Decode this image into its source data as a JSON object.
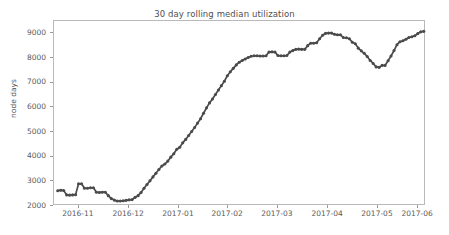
{
  "chart_data": {
    "type": "line",
    "title": "30 day rolling median utilization",
    "xlabel": "",
    "ylabel": "node days",
    "grid": false,
    "legend": null,
    "marker": "circle",
    "line_color": "#4a4a4a",
    "ylim": [
      2000,
      9500
    ],
    "yticks": [
      2000,
      3000,
      4000,
      5000,
      6000,
      7000,
      8000,
      9000
    ],
    "ytick_labels": [
      "2000",
      "3000",
      "4000",
      "5000",
      "6000",
      "7000",
      "8000",
      "9000"
    ],
    "xticks": [
      "2016-11",
      "2016-12",
      "2017-01",
      "2017-02",
      "2017-03",
      "2017-04",
      "2017-05",
      "2017-06"
    ],
    "xtick_positions_frac": [
      0.067,
      0.202,
      0.336,
      0.468,
      0.602,
      0.737,
      0.871,
      0.979
    ],
    "x": [
      0.01,
      0.018,
      0.026,
      0.034,
      0.042,
      0.05,
      0.058,
      0.066,
      0.074,
      0.082,
      0.09,
      0.098,
      0.106,
      0.114,
      0.122,
      0.13,
      0.138,
      0.146,
      0.154,
      0.162,
      0.17,
      0.178,
      0.186,
      0.194,
      0.202,
      0.21,
      0.218,
      0.226,
      0.234,
      0.242,
      0.25,
      0.258,
      0.266,
      0.274,
      0.282,
      0.29,
      0.298,
      0.306,
      0.314,
      0.322,
      0.33,
      0.338,
      0.346,
      0.354,
      0.362,
      0.37,
      0.378,
      0.386,
      0.394,
      0.402,
      0.41,
      0.418,
      0.426,
      0.434,
      0.442,
      0.45,
      0.458,
      0.466,
      0.474,
      0.482,
      0.49,
      0.498,
      0.506,
      0.514,
      0.522,
      0.53,
      0.538,
      0.546,
      0.554,
      0.562,
      0.57,
      0.578,
      0.586,
      0.594,
      0.602,
      0.61,
      0.618,
      0.626,
      0.634,
      0.642,
      0.65,
      0.658,
      0.666,
      0.674,
      0.682,
      0.69,
      0.698,
      0.706,
      0.714,
      0.722,
      0.73,
      0.738,
      0.746,
      0.754,
      0.762,
      0.77,
      0.778,
      0.786,
      0.794,
      0.802,
      0.81,
      0.818,
      0.826,
      0.834,
      0.842,
      0.85,
      0.858,
      0.866,
      0.874,
      0.882,
      0.89,
      0.898,
      0.906,
      0.914,
      0.922,
      0.93,
      0.938,
      0.946,
      0.954,
      0.962,
      0.97,
      0.978,
      0.986,
      0.994
    ],
    "y": [
      2620,
      2640,
      2630,
      2450,
      2440,
      2450,
      2460,
      2900,
      2900,
      2720,
      2720,
      2740,
      2740,
      2560,
      2550,
      2560,
      2560,
      2420,
      2300,
      2240,
      2200,
      2200,
      2210,
      2230,
      2250,
      2260,
      2350,
      2420,
      2550,
      2720,
      2870,
      3020,
      3180,
      3330,
      3480,
      3620,
      3700,
      3820,
      3980,
      4120,
      4300,
      4380,
      4560,
      4700,
      4860,
      5020,
      5180,
      5360,
      5540,
      5760,
      5980,
      6180,
      6340,
      6520,
      6700,
      6880,
      7060,
      7280,
      7440,
      7580,
      7720,
      7830,
      7900,
      7960,
      8020,
      8070,
      8090,
      8090,
      8080,
      8080,
      8090,
      8240,
      8250,
      8240,
      8100,
      8090,
      8090,
      8100,
      8240,
      8300,
      8350,
      8360,
      8350,
      8350,
      8500,
      8600,
      8600,
      8620,
      8780,
      8920,
      9000,
      9010,
      9010,
      8960,
      8940,
      8940,
      8830,
      8820,
      8780,
      8640,
      8580,
      8400,
      8290,
      8190,
      8060,
      7900,
      7780,
      7640,
      7620,
      7700,
      7700,
      7890,
      8080,
      8300,
      8540,
      8660,
      8700,
      8760,
      8830,
      8860,
      8900,
      8990,
      9060,
      9080
    ]
  }
}
